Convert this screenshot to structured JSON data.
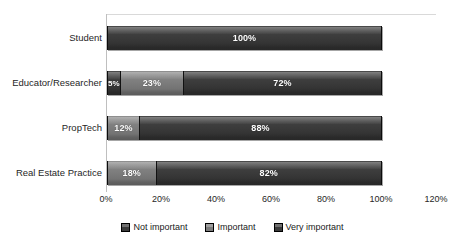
{
  "chart_data": {
    "type": "bar",
    "orientation": "horizontal",
    "stacked": true,
    "title": "",
    "subtitle": "",
    "xlabel": "",
    "ylabel": "",
    "xlim": [
      0,
      120
    ],
    "xticks": [
      "0%",
      "20%",
      "40%",
      "60%",
      "80%",
      "100%",
      "120%"
    ],
    "xtick_values": [
      0,
      20,
      40,
      60,
      80,
      100,
      120
    ],
    "grid": false,
    "legend_position": "bottom-center",
    "categories": [
      "Student",
      "Educator/Researcher",
      "PropTech",
      "Real Estate Practice"
    ],
    "series": [
      {
        "name": "Not important",
        "color": "#3a3a3a",
        "values": [
          0,
          5,
          0,
          0
        ],
        "labels": [
          "",
          "5%",
          "",
          ""
        ]
      },
      {
        "name": "Important",
        "color": "#7b7b7b",
        "values": [
          0,
          23,
          12,
          18
        ],
        "labels": [
          "",
          "23%",
          "12%",
          "18%"
        ]
      },
      {
        "name": "Very important",
        "color": "#3a3a3a",
        "values": [
          100,
          72,
          88,
          82
        ],
        "labels": [
          "100%",
          "72%",
          "88%",
          "82%"
        ]
      }
    ],
    "rows": [
      {
        "category": "Student",
        "segments": [
          {
            "series": "Very important",
            "value": 100,
            "label": "100%",
            "tone": "dark"
          }
        ]
      },
      {
        "category": "Educator/Researcher",
        "segments": [
          {
            "series": "Not important",
            "value": 5,
            "label": "5%",
            "tone": "dark"
          },
          {
            "series": "Important",
            "value": 23,
            "label": "23%",
            "tone": "mid"
          },
          {
            "series": "Very important",
            "value": 72,
            "label": "72%",
            "tone": "dark"
          }
        ]
      },
      {
        "category": "PropTech",
        "segments": [
          {
            "series": "Important",
            "value": 12,
            "label": "12%",
            "tone": "mid"
          },
          {
            "series": "Very important",
            "value": 88,
            "label": "88%",
            "tone": "dark"
          }
        ]
      },
      {
        "category": "Real Estate Practice",
        "segments": [
          {
            "series": "Important",
            "value": 18,
            "label": "18%",
            "tone": "mid"
          },
          {
            "series": "Very important",
            "value": 82,
            "label": "82%",
            "tone": "dark"
          }
        ]
      }
    ]
  },
  "colors": {
    "dark": "#3a3a3a",
    "mid": "#7b7b7b",
    "axis": "#bfbfbf",
    "text": "#262626",
    "label_text": "#ffffff",
    "background": "#ffffff"
  }
}
